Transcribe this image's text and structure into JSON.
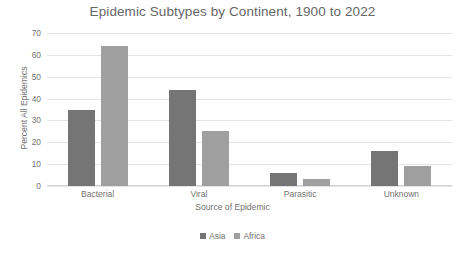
{
  "chart_data": {
    "type": "bar",
    "title": "Epidemic Subtypes by Continent, 1900 to 2022",
    "xlabel": "Source of Epidemic",
    "ylabel": "Percent All Epidemics",
    "categories": [
      "Bacterial",
      "Viral",
      "Parasitic",
      "Unknown"
    ],
    "series": [
      {
        "name": "Asia",
        "color": "#6e6e6e",
        "values": [
          35,
          44,
          6,
          16
        ]
      },
      {
        "name": "Africa",
        "color": "#9a9a9a",
        "values": [
          64,
          25,
          3,
          9
        ]
      }
    ],
    "ylim": [
      0,
      70
    ],
    "ytick_step": 10,
    "yticks": [
      "70",
      "60",
      "50",
      "40",
      "30",
      "20",
      "10",
      "0"
    ],
    "grid": true,
    "legend_position": "bottom-center"
  }
}
